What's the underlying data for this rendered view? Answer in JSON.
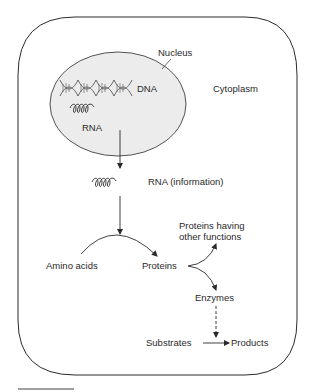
{
  "labels": {
    "nucleus": "Nucleus",
    "dna": "DNA",
    "rna_nucleus": "RNA",
    "cytoplasm": "Cytoplasm",
    "rna_info": "RNA (information)",
    "amino_acids": "Amino acids",
    "proteins": "Proteins",
    "proteins_other_1": "Proteins having",
    "proteins_other_2": "other functions",
    "enzymes": "Enzymes",
    "substrates": "Substrates",
    "products": "Products"
  },
  "colors": {
    "stroke": "#2a2a2a",
    "nucleus_fill": "#ececec"
  }
}
